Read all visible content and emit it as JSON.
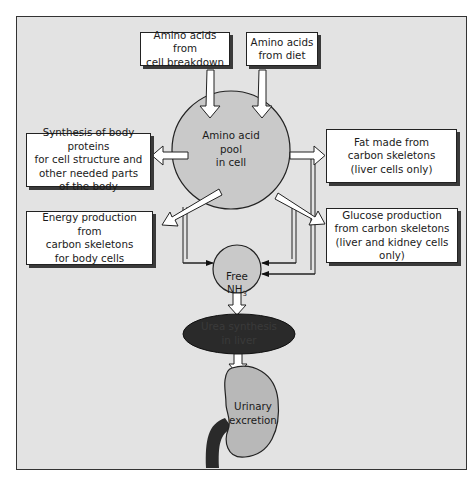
{
  "diagram": {
    "title": "",
    "colors": {
      "background": "#e3e3e3",
      "box_fill": "#ffffff",
      "pool_fill": "#c9c9c9",
      "nh3_fill": "#c9c9c9",
      "urea_fill": "#2a2a2a",
      "kidney_fill": "#b8b8b8",
      "ureter": "#2a2a2a",
      "outline": "#222222"
    },
    "inputs": [
      {
        "id": "cell-breakdown",
        "label": "Amino acids from\ncell breakdown"
      },
      {
        "id": "diet",
        "label": "Amino acids\nfrom diet"
      }
    ],
    "pool": {
      "label": "Amino acid\npool\nin cell"
    },
    "outputs_left": [
      {
        "id": "protein-synthesis",
        "label": "Synthesis of body proteins\nfor cell structure and\nother needed parts\nof the body"
      },
      {
        "id": "energy-production",
        "label": "Energy production from\ncarbon skeletons\nfor body cells"
      }
    ],
    "outputs_right": [
      {
        "id": "fat",
        "label": "Fat made from\ncarbon skeletons\n(liver cells only)"
      },
      {
        "id": "glucose",
        "label": "Glucose production\nfrom carbon skeletons\n(liver and kidney cells only)"
      }
    ],
    "nh3": {
      "label": "Free\nNH",
      "subscript": "3"
    },
    "urea": {
      "label": "Urea synthesis\nin liver"
    },
    "kidney": {
      "label": "Urinary\nexcretion"
    }
  }
}
